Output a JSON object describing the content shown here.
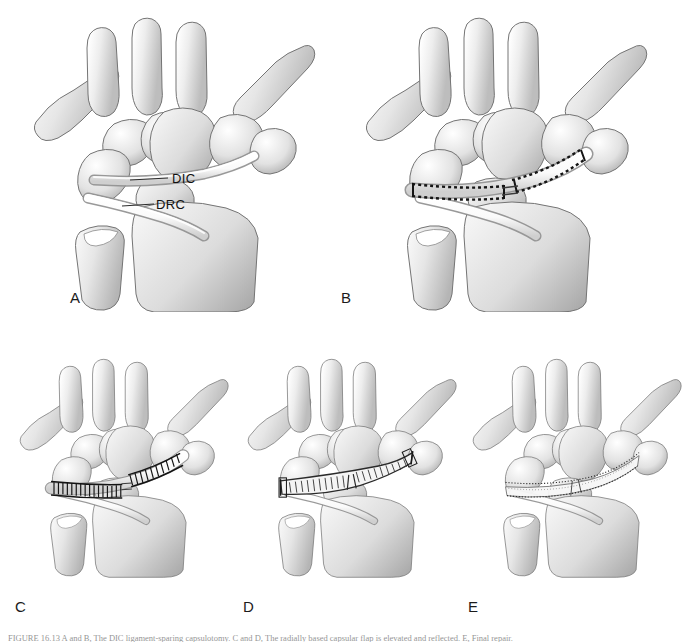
{
  "figure": {
    "type": "medical-illustration",
    "view": "dorsal view of right wrist",
    "background_color": "#ffffff",
    "bone_fill_light": "#f2f2f2",
    "bone_fill_mid": "#d9d9d9",
    "bone_fill_dark": "#b0b0b0",
    "outline_color": "#6e6e6e",
    "ink_color": "#1b1b1b",
    "panel_count": 5
  },
  "panels": [
    {
      "letter": "A",
      "letter_x": 70,
      "letter_y": 290,
      "title": "Normal dorsal wrist ligament anatomy",
      "description": "Dorsal view of the carpus demonstrating the dorsal intercarpal (DIC) and dorsal radiocarpal (DRC) ligaments forming a lateral V.",
      "labels": [
        {
          "text": "DIC",
          "x": 172,
          "y": 172,
          "full_name": "dorsal intercarpal ligament"
        },
        {
          "text": "DRC",
          "x": 156,
          "y": 198,
          "full_name": "dorsal radiocarpal ligament"
        }
      ]
    },
    {
      "letter": "B",
      "letter_x": 341,
      "letter_y": 290,
      "title": "Planned capsulotomy incisions",
      "description": "Dashed incision lines marked along the borders of the dorsal intercarpal ligament to raise a radially based flap.",
      "labels": []
    },
    {
      "letter": "C",
      "letter_x": 15,
      "letter_y": 601,
      "title": "Capsular flap elevated",
      "description": "The ligament-sparing capsulotomy is completed and the flap is elevated off the carpus.",
      "labels": []
    },
    {
      "letter": "D",
      "letter_x": 243,
      "letter_y": 601,
      "title": "Flap reflected for joint exposure",
      "description": "The capsular flap is reflected distally, exposing the scapholunate interval and the proximal carpal row.",
      "labels": []
    },
    {
      "letter": "E",
      "letter_x": 468,
      "letter_y": 601,
      "title": "Capsule repaired",
      "description": "The dorsal capsule is closed and the ligamentous repair is completed.",
      "labels": []
    }
  ],
  "anatomy": {
    "bones": [
      "first metacarpal",
      "second metacarpal",
      "third metacarpal",
      "fourth metacarpal",
      "fifth metacarpal",
      "trapezium",
      "trapezoid",
      "capitate",
      "hamate",
      "scaphoid",
      "lunate",
      "triquetrum",
      "radius",
      "ulna"
    ],
    "ligaments": [
      {
        "abbr": "DIC",
        "name": "Dorsal intercarpal ligament"
      },
      {
        "abbr": "DRC",
        "name": "Dorsal radiocarpal ligament"
      }
    ]
  },
  "caption": {
    "text": "FIGURE 16.13  A and B, The DIC ligament-sparing capsulotomy. C and D, The radially based capsular flap is elevated and reflected. E, Final repair."
  }
}
